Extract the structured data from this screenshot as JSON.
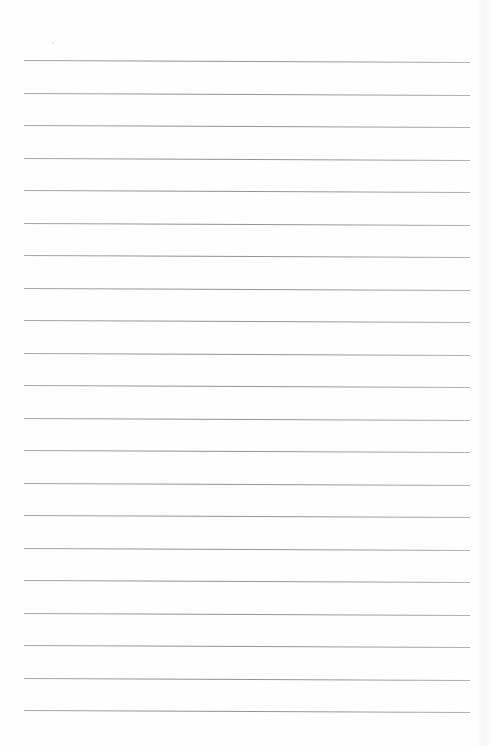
{
  "page": {
    "type": "lined-paper",
    "background_color": "#fefefe",
    "line_color": "#999999",
    "line_count": 21,
    "line_start_y": 60,
    "line_spacing": 32.5,
    "line_left_x": 24,
    "line_right_x": 470
  },
  "lines": [
    {
      "index": 1,
      "y": 60
    },
    {
      "index": 2,
      "y": 92.5
    },
    {
      "index": 3,
      "y": 125
    },
    {
      "index": 4,
      "y": 157.5
    },
    {
      "index": 5,
      "y": 190
    },
    {
      "index": 6,
      "y": 222.5
    },
    {
      "index": 7,
      "y": 255
    },
    {
      "index": 8,
      "y": 287.5
    },
    {
      "index": 9,
      "y": 320
    },
    {
      "index": 10,
      "y": 352.5
    },
    {
      "index": 11,
      "y": 385
    },
    {
      "index": 12,
      "y": 417.5
    },
    {
      "index": 13,
      "y": 450
    },
    {
      "index": 14,
      "y": 482.5
    },
    {
      "index": 15,
      "y": 515
    },
    {
      "index": 16,
      "y": 547.5
    },
    {
      "index": 17,
      "y": 580
    },
    {
      "index": 18,
      "y": 612.5
    },
    {
      "index": 19,
      "y": 645
    },
    {
      "index": 20,
      "y": 677.5
    },
    {
      "index": 21,
      "y": 710
    }
  ]
}
